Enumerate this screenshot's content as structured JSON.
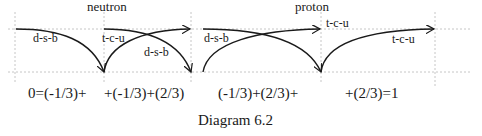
{
  "diagram": {
    "caption": "Diagram 6.2",
    "sections": [
      {
        "title": "neutron",
        "labels": {
          "dsb_left": "d-s-b",
          "tcu": "t-c-u",
          "dsb_right": "d-s-b"
        }
      },
      {
        "title": "proton",
        "labels": {
          "dsb": "d-s-b",
          "tcu_top": "t-c-u",
          "tcu_right": "t-c-u"
        }
      }
    ],
    "equation_terms": [
      "0=(-1/3)+",
      "+(-1/3)+(2/3)",
      "(-1/3)+(2/3)+",
      "+(2/3)=1"
    ],
    "colors": {
      "curve": "#1a1a1a",
      "grid": "#b8b8b8",
      "text": "#1a1a1a"
    }
  }
}
